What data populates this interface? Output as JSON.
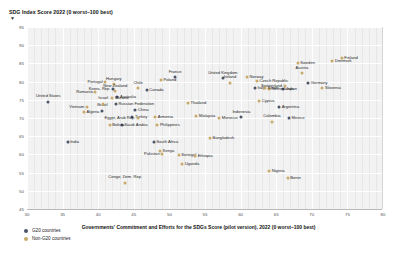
{
  "chart_data": {
    "type": "scatter",
    "title": "SDG Index Score 2022 (0 worst–100 best)",
    "ylabel": "SDG Index Score 2022 (0 worst–100 best)",
    "xlabel": "Governments' Commitment and Efforts for the SDGs Score (pilot version), 2022 (0 worst–100 best)",
    "xlim": [
      30,
      80
    ],
    "ylim": [
      45,
      95
    ],
    "xticks": [
      30,
      35,
      40,
      45,
      50,
      55,
      60,
      65,
      70,
      75,
      80
    ],
    "yticks": [
      45,
      50,
      55,
      60,
      65,
      70,
      75,
      80,
      85,
      90,
      95
    ],
    "grid": true,
    "legend_position": "bottom-left",
    "series": [
      {
        "name": "G20 countries",
        "color": "#4a5568",
        "points": [
          {
            "label": "United States",
            "x": 33.0,
            "y": 74.5,
            "pos": "cb"
          },
          {
            "label": "Russian Federation",
            "x": 42.5,
            "y": 73.8,
            "pos": "r"
          },
          {
            "label": "Brazil",
            "x": 40.6,
            "y": 72.0,
            "pos": "cb"
          },
          {
            "label": "China",
            "x": 45.2,
            "y": 72.1,
            "pos": "r"
          },
          {
            "label": "Korea, Rep.",
            "x": 42.1,
            "y": 77.9,
            "pos": "l"
          },
          {
            "label": "Canada",
            "x": 46.8,
            "y": 77.7,
            "pos": "r"
          },
          {
            "label": "France",
            "x": 50.8,
            "y": 81.2,
            "pos": "cb"
          },
          {
            "label": "United Kingdom",
            "x": 57.5,
            "y": 81.0,
            "pos": "cb"
          },
          {
            "label": "Germany",
            "x": 69.5,
            "y": 79.6,
            "pos": "r"
          },
          {
            "label": "Japan",
            "x": 66.0,
            "y": 78.0,
            "pos": "r"
          },
          {
            "label": "Turkey",
            "x": 44.8,
            "y": 70.4,
            "pos": "r"
          },
          {
            "label": "Saudi Arabia",
            "x": 43.3,
            "y": 68.2,
            "pos": "r"
          },
          {
            "label": "Indonesia",
            "x": 60.1,
            "y": 70.2,
            "pos": "cb"
          },
          {
            "label": "Mexico",
            "x": 66.8,
            "y": 70.0,
            "pos": "r"
          },
          {
            "label": "Argentina",
            "x": 65.4,
            "y": 73.0,
            "pos": "r"
          },
          {
            "label": "Australia",
            "x": 42.7,
            "y": 75.9,
            "pos": "r"
          },
          {
            "label": "Italy",
            "x": 62.0,
            "y": 78.3,
            "pos": "r"
          },
          {
            "label": "India",
            "x": 35.7,
            "y": 63.5,
            "pos": "r"
          },
          {
            "label": "South Africa",
            "x": 47.8,
            "y": 63.4,
            "pos": "r"
          }
        ]
      },
      {
        "name": "Non-G20 countries",
        "color": "#c8a96a",
        "points": [
          {
            "label": "Finland",
            "x": 74.2,
            "y": 86.5,
            "pos": "r"
          },
          {
            "label": "Denmark",
            "x": 72.9,
            "y": 85.6,
            "pos": "r"
          },
          {
            "label": "Sweden",
            "x": 68.0,
            "y": 85.2,
            "pos": "r"
          },
          {
            "label": "Austria",
            "x": 68.6,
            "y": 82.3,
            "pos": "cb"
          },
          {
            "label": "Switzerland",
            "x": 66.2,
            "y": 78.8,
            "pos": "l"
          },
          {
            "label": "Netherlands",
            "x": 64.0,
            "y": 78.0,
            "pos": "r"
          },
          {
            "label": "Slovenia",
            "x": 71.5,
            "y": 78.2,
            "pos": "r"
          },
          {
            "label": "Norway",
            "x": 60.9,
            "y": 81.2,
            "pos": "r"
          },
          {
            "label": "Ireland",
            "x": 58.5,
            "y": 79.7,
            "pos": "cb"
          },
          {
            "label": "Poland",
            "x": 48.8,
            "y": 80.5,
            "pos": "r"
          },
          {
            "label": "Czech Republic",
            "x": 62.3,
            "y": 80.3,
            "pos": "r"
          },
          {
            "label": "Portugal",
            "x": 41.0,
            "y": 79.8,
            "pos": "l"
          },
          {
            "label": "Hungary",
            "x": 42.2,
            "y": 79.3,
            "pos": "cb"
          },
          {
            "label": "New Zealand",
            "x": 42.4,
            "y": 77.3,
            "pos": "cb"
          },
          {
            "label": "Chile",
            "x": 45.6,
            "y": 78.2,
            "pos": "cb"
          },
          {
            "label": "Romania",
            "x": 39.6,
            "y": 77.2,
            "pos": "l"
          },
          {
            "label": "Ukraine",
            "x": 42.0,
            "y": 75.4,
            "pos": "r"
          },
          {
            "label": "Spain",
            "x": 63.4,
            "y": 78.2,
            "pos": "r"
          },
          {
            "label": "Israel",
            "x": 40.7,
            "y": 73.9,
            "pos": "cb"
          },
          {
            "label": "Vietnam",
            "x": 38.4,
            "y": 73.0,
            "pos": "l"
          },
          {
            "label": "Algeria",
            "x": 38.0,
            "y": 71.6,
            "pos": "r"
          },
          {
            "label": "Bolivia",
            "x": 41.6,
            "y": 68.2,
            "pos": "r"
          },
          {
            "label": "Thailand",
            "x": 52.6,
            "y": 74.2,
            "pos": "r"
          },
          {
            "label": "Cyprus",
            "x": 62.6,
            "y": 74.6,
            "pos": "r"
          },
          {
            "label": "Malaysia",
            "x": 53.8,
            "y": 70.5,
            "pos": "r"
          },
          {
            "label": "Armenia",
            "x": 48.0,
            "y": 70.2,
            "pos": "r"
          },
          {
            "label": "Egypt, Arab Rep.",
            "x": 45.6,
            "y": 70.1,
            "pos": "l"
          },
          {
            "label": "Morocco",
            "x": 57.0,
            "y": 70.1,
            "pos": "r"
          },
          {
            "label": "Colombia",
            "x": 64.4,
            "y": 69.0,
            "pos": "cb"
          },
          {
            "label": "Philippines",
            "x": 48.3,
            "y": 68.0,
            "pos": "r"
          },
          {
            "label": "Bangladesh",
            "x": 55.7,
            "y": 64.5,
            "pos": "r"
          },
          {
            "label": "Kenya",
            "x": 48.7,
            "y": 61.0,
            "pos": "r"
          },
          {
            "label": "Senegal",
            "x": 51.3,
            "y": 59.8,
            "pos": "r"
          },
          {
            "label": "Pakistan",
            "x": 49.0,
            "y": 60.0,
            "pos": "l"
          },
          {
            "label": "Ethiopia",
            "x": 53.6,
            "y": 59.6,
            "pos": "r"
          },
          {
            "label": "Uganda",
            "x": 51.8,
            "y": 57.4,
            "pos": "r"
          },
          {
            "label": "Nigeria",
            "x": 64.0,
            "y": 55.5,
            "pos": "r"
          },
          {
            "label": "Benin",
            "x": 66.6,
            "y": 53.4,
            "pos": "r"
          },
          {
            "label": "Congo, Dem. Rep.",
            "x": 43.8,
            "y": 52.2,
            "pos": "cb"
          }
        ]
      }
    ]
  },
  "legend": {
    "items": [
      {
        "label": "G20 countries",
        "color": "#4a5568"
      },
      {
        "label": "Non-G20 countries",
        "color": "#c8a96a"
      }
    ]
  }
}
